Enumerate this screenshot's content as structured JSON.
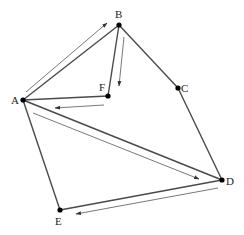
{
  "diagram": {
    "type": "graph-path",
    "colors": {
      "edge": "#4a4a4a",
      "arrow": "#555555",
      "node": "#000000",
      "label": "#222222",
      "background": "#ffffff"
    },
    "nodes": [
      {
        "id": "A",
        "label": "A",
        "x": 23,
        "y": 100,
        "lx": 11,
        "ly": 104
      },
      {
        "id": "B",
        "label": "B",
        "x": 119,
        "y": 25,
        "lx": 115,
        "ly": 18
      },
      {
        "id": "C",
        "label": "C",
        "x": 178,
        "y": 88,
        "lx": 181,
        "ly": 92
      },
      {
        "id": "D",
        "label": "D",
        "x": 222,
        "y": 180,
        "lx": 226,
        "ly": 185
      },
      {
        "id": "E",
        "label": "E",
        "x": 60,
        "y": 210,
        "lx": 55,
        "ly": 225
      },
      {
        "id": "F",
        "label": "F",
        "x": 108,
        "y": 96,
        "lx": 99,
        "ly": 91
      }
    ],
    "edges": [
      {
        "from": "A",
        "to": "B"
      },
      {
        "from": "B",
        "to": "F"
      },
      {
        "from": "F",
        "to": "A"
      },
      {
        "from": "B",
        "to": "C"
      },
      {
        "from": "C",
        "to": "D"
      },
      {
        "from": "A",
        "to": "D"
      },
      {
        "from": "D",
        "to": "E"
      },
      {
        "from": "E",
        "to": "A"
      }
    ],
    "path_arrows": [
      {
        "name": "arrow-a-to-b",
        "x1": 26,
        "y1": 92,
        "x2": 107,
        "y2": 23
      },
      {
        "name": "arrow-b-to-f",
        "x1": 124,
        "y1": 37,
        "x2": 119,
        "y2": 86
      },
      {
        "name": "arrow-f-to-a",
        "x1": 104,
        "y1": 105,
        "x2": 55,
        "y2": 108
      },
      {
        "name": "arrow-a-to-d",
        "x1": 33,
        "y1": 113,
        "x2": 199,
        "y2": 179
      },
      {
        "name": "arrow-d-to-e",
        "x1": 218,
        "y1": 188,
        "x2": 76,
        "y2": 214
      }
    ]
  }
}
